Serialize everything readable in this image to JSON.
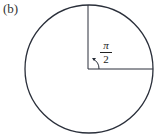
{
  "figure": {
    "label": "(b)",
    "angle_label": {
      "numerator": "π",
      "denominator": "2"
    },
    "circle": {
      "cx": 89,
      "cy": 69,
      "r": 64,
      "stroke": "#2a2f3a"
    },
    "colors": {
      "line": "#2a2f3a",
      "background": "#ffffff"
    }
  }
}
